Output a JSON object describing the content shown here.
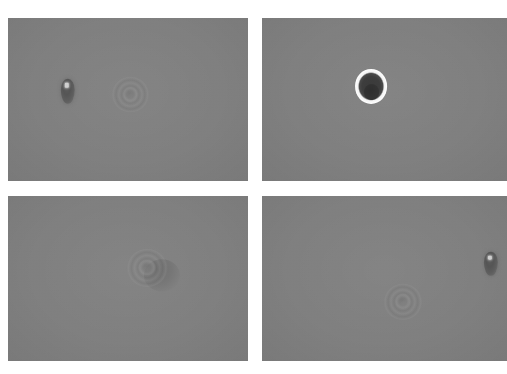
{
  "figure": {
    "caption_text": "",
    "background_color": "#ffffff",
    "panel_background": "#808080",
    "rows": 2,
    "columns": 2,
    "panel_count": 4
  },
  "panels": [
    {
      "id": "panel-top-left",
      "position": "top-left",
      "label": "",
      "background": "#808080",
      "features": [
        {
          "name": "dark-particle",
          "kind": "blob-dark",
          "cx_pct": 25.0,
          "cy_pct": 45.0,
          "w_pct": 6.0,
          "h_pct": 15.0
        },
        {
          "name": "faint-diffraction-ring",
          "kind": "ring-faint",
          "cx_pct": 51.0,
          "cy_pct": 47.0,
          "w_pct": 15.5,
          "h_pct": 22.0
        }
      ]
    },
    {
      "id": "panel-top-right",
      "position": "top-right",
      "label": "",
      "background": "#808080",
      "features": [
        {
          "name": "bright-ring-particle",
          "kind": "ring-bright",
          "cx_pct": 44.5,
          "cy_pct": 42.0,
          "w_pct": 13.0,
          "h_pct": 21.0
        }
      ]
    },
    {
      "id": "panel-bottom-left",
      "position": "bottom-left",
      "label": "",
      "background": "#808080",
      "features": [
        {
          "name": "faint-diffraction-ring",
          "kind": "ring-faint",
          "cx_pct": 58.0,
          "cy_pct": 43.5,
          "w_pct": 17.0,
          "h_pct": 23.0
        },
        {
          "name": "crescent-shadow",
          "kind": "crescent",
          "cx_pct": 64.0,
          "cy_pct": 48.0,
          "w_pct": 15.0,
          "h_pct": 19.0
        }
      ]
    },
    {
      "id": "panel-bottom-right",
      "position": "bottom-right",
      "label": "",
      "background": "#808080",
      "features": [
        {
          "name": "faint-diffraction-ring",
          "kind": "ring-faint",
          "cx_pct": 57.5,
          "cy_pct": 64.0,
          "w_pct": 16.0,
          "h_pct": 22.0
        },
        {
          "name": "dark-particle",
          "kind": "blob-dark",
          "cx_pct": 93.5,
          "cy_pct": 41.0,
          "w_pct": 5.8,
          "h_pct": 15.0
        }
      ]
    }
  ]
}
